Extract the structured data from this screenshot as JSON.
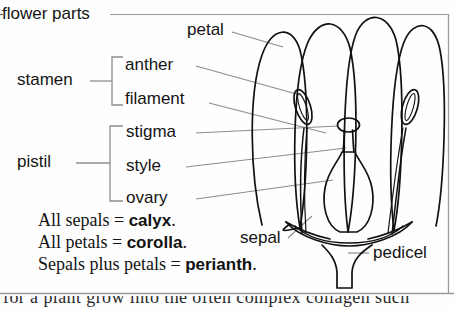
{
  "diagram": {
    "title": "flower parts",
    "type": "botanical-flower-anatomy-diagram",
    "groups": [
      {
        "name": "stamen",
        "label": "stamen",
        "members": [
          "anther",
          "filament"
        ]
      },
      {
        "name": "pistil",
        "label": "pistil",
        "members": [
          "stigma",
          "style",
          "ovary"
        ]
      }
    ],
    "labels": {
      "flower_parts": "flower parts",
      "petal": "petal",
      "stamen": "stamen",
      "anther": "anther",
      "filament": "filament",
      "pistil": "pistil",
      "stigma": "stigma",
      "style": "style",
      "ovary": "ovary",
      "sepal": "sepal",
      "pedicel": "pedicel"
    },
    "definitions": [
      {
        "subject": "All sepals",
        "equals": "=",
        "term": "calyx",
        "period": "."
      },
      {
        "subject": "All petals",
        "equals": "=",
        "term": "corolla",
        "period": "."
      },
      {
        "subject": "Sepals plus petals",
        "equals": "=",
        "term": "perianth",
        "period": "."
      }
    ],
    "caption_clipped": "for a plant grow into the often complex collagen such",
    "colors": {
      "ink": "#141414",
      "leader_line": "#8d8d8d",
      "bracket": "#8d8d8d",
      "border": "#9a9a9a",
      "background": "#fefefe"
    }
  }
}
